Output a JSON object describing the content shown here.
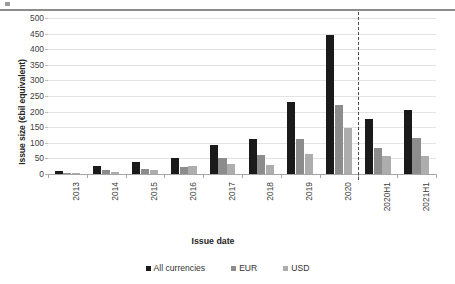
{
  "chart_data": {
    "type": "bar",
    "title": "",
    "xlabel": "Issue date",
    "ylabel": "Issue size (€bil equivalent)",
    "ylim": [
      0,
      500
    ],
    "y_ticks": [
      0,
      50,
      100,
      150,
      200,
      250,
      300,
      350,
      400,
      450,
      500
    ],
    "grid": true,
    "legend_position": "bottom",
    "categories": [
      "2013",
      "2014",
      "2015",
      "2016",
      "2017",
      "2018",
      "2019",
      "2020",
      "2020H1",
      "2021H1"
    ],
    "series": [
      {
        "name": "All currencies",
        "color": "#1a1a1a",
        "values": [
          9,
          27,
          37,
          52,
          93,
          112,
          230,
          447,
          176,
          206
        ]
      },
      {
        "name": "EUR",
        "color": "#8c8c8c",
        "values": [
          4,
          13,
          17,
          22,
          51,
          60,
          112,
          222,
          82,
          117
        ]
      },
      {
        "name": "USD",
        "color": "#adadad",
        "values": [
          2,
          5,
          12,
          25,
          31,
          28,
          64,
          148,
          59,
          58
        ]
      }
    ],
    "annotations": [
      {
        "type": "vertical-dashed-divider",
        "after_category": "2020",
        "color": "#4d4d4d"
      }
    ]
  },
  "legend": {
    "items": [
      {
        "label": "All currencies",
        "color": "#1a1a1a"
      },
      {
        "label": "EUR",
        "color": "#8c8c8c"
      },
      {
        "label": "USD",
        "color": "#adadad"
      }
    ]
  }
}
